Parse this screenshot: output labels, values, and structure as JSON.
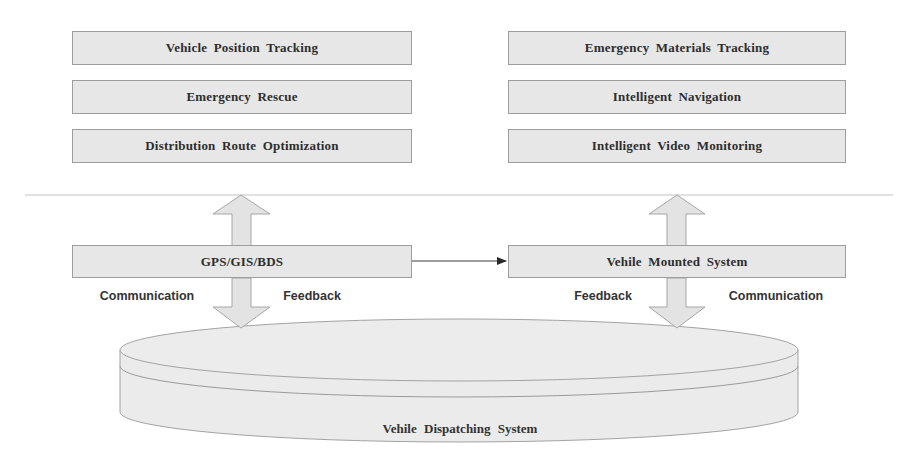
{
  "diagram": {
    "application_layer": {
      "left_column": [
        {
          "label": "Vehicle Position Tracking"
        },
        {
          "label": "Emergency Rescue"
        },
        {
          "label": "Distribution Route Optimization"
        }
      ],
      "right_column": [
        {
          "label": "Emergency Materials Tracking"
        },
        {
          "label": "Intelligent Navigation"
        },
        {
          "label": "Intelligent Video Monitoring"
        }
      ]
    },
    "middle_layer": {
      "left_node": {
        "label": "GPS/GIS/BDS"
      },
      "right_node": {
        "label": "Vehile Mounted System"
      },
      "left_labels": {
        "left": "Communication",
        "right": "Feedback"
      },
      "right_labels": {
        "left": "Feedback",
        "right": "Communication"
      }
    },
    "base": {
      "label": "Vehile Dispatching System"
    },
    "edges": [
      {
        "from": "GPS/GIS/BDS",
        "to": "Vehile Mounted System",
        "type": "directed"
      },
      {
        "from": "GPS/GIS/BDS",
        "to": "application_layer_left",
        "type": "bidirectional"
      },
      {
        "from": "GPS/GIS/BDS",
        "to": "Vehile Dispatching System",
        "type": "bidirectional"
      },
      {
        "from": "Vehile Mounted System",
        "to": "application_layer_right",
        "type": "bidirectional"
      },
      {
        "from": "Vehile Mounted System",
        "to": "Vehile Dispatching System",
        "type": "bidirectional"
      }
    ],
    "colors": {
      "box_fill": "#e7e7e7",
      "box_border": "#9d9d9d",
      "text": "#2e2e2e",
      "divider": "#bdbdbd"
    }
  }
}
